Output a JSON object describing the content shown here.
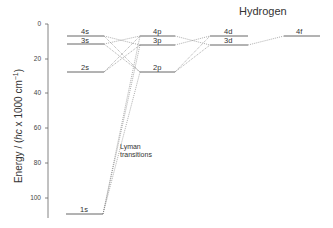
{
  "title": "Hydrogen",
  "axis": {
    "ylabel_prefix": "Energy / (",
    "ylabel_italic": "hc",
    "ylabel_suffix": " x 1000 cm",
    "ylabel_sup": "−1",
    "ylabel_close": ")",
    "ticks": [
      "0",
      "20",
      "40",
      "60",
      "80",
      "100"
    ]
  },
  "levels": {
    "s4": "4s",
    "s3": "3s",
    "s2": "2s",
    "s1": "1s",
    "p4": "4p",
    "p3": "3p",
    "p2": "2p",
    "d4": "4d",
    "d3": "3d",
    "f4": "4f"
  },
  "annotation": {
    "line1": "Lyman",
    "line2": "transitions"
  },
  "colors": {
    "level_line": "#555555",
    "transition_line": "#777777",
    "axis": "#666666"
  }
}
